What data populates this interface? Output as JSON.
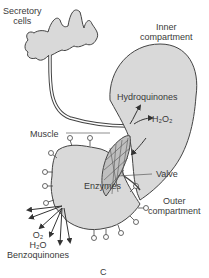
{
  "figure": {
    "panel_label": "C",
    "labels": {
      "secretory_cells_line1": "Secretory",
      "secretory_cells_line2": "cells",
      "inner_compartment_line1": "Inner",
      "inner_compartment_line2": "compartment",
      "hydroquinones": "Hydroquinones",
      "h2o2": "H₂O₂",
      "muscle": "Muscle",
      "valve": "Valve",
      "enzymes": "Enzymes",
      "outer_compartment_line1": "Outer",
      "outer_compartment_line2": "compartment",
      "o2": "O₂",
      "h2o": "H₂O",
      "benzoquinones": "Benzoquinones"
    },
    "colors": {
      "fill": "#d9d9d9",
      "stroke": "#444444",
      "text": "#3a3a3a"
    }
  }
}
